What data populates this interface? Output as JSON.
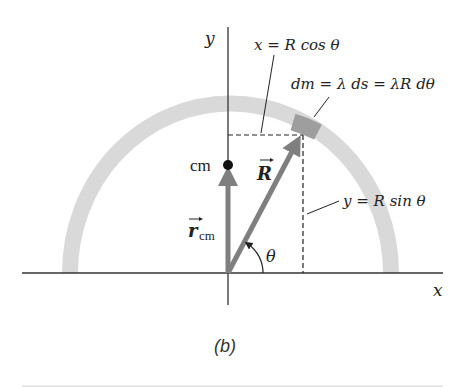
{
  "figure": {
    "caption": "(b)",
    "colors": {
      "arc": "#d9d9d9",
      "dm_segment": "#9e9e9e",
      "vector": "#7f7f7f",
      "axis": "#333333",
      "rule": "#d0d0d0"
    }
  },
  "axes": {
    "x_label": "x",
    "y_label": "y"
  },
  "labels": {
    "x_eq": "x = R cos θ",
    "y_eq": "y = R sin θ",
    "dm_eq": "dm = λ ds = λR dθ",
    "cm": "cm",
    "R_vec": "R",
    "r_cm": "r",
    "r_cm_sub": "cm",
    "theta": "θ"
  }
}
